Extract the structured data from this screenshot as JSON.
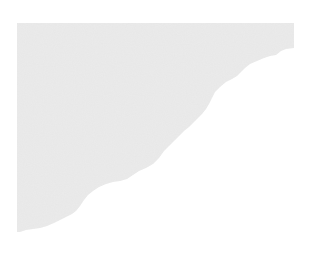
{
  "image": {
    "description": "Light gray textured paper fragment with a torn wavy diagonal edge on a white background",
    "width": 313,
    "height": 257,
    "background_color": "#ffffff",
    "shape": {
      "fill_color": "#ebebeb",
      "grain_color": "#e2e2e2",
      "highlight_color": "#f1f1f1",
      "points": "17,23 294,23 294,48 286,49 281,51 276,55 270,56 264,58 257,61 250,64 245,68 241,72 237,76 232,79 226,82 220,87 215,92 212,98 209,104 206,109 202,114 198,118 194,122 189,127 184,131 179,136 174,141 169,146 164,151 159,158 153,164 146,168 139,171 133,175 127,179 120,181 113,182 106,184 99,187 93,191 88,195 84,200 80,206 76,211 72,214 66,217 60,220 54,223 47,226 40,228 33,229 26,230 20,232 17,232"
    }
  }
}
